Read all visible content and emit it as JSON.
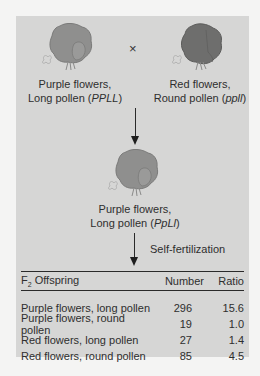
{
  "diagram": {
    "parents": {
      "left": {
        "line1": "Purple flowers,",
        "line2_prefix": "Long pollen (",
        "genotype": "PPLL",
        "line2_suffix": ")",
        "flower_color": "#8f8f8e"
      },
      "cross_symbol": "×",
      "right": {
        "line1": "Red flowers,",
        "line2_prefix": "Round pollen (",
        "genotype": "ppll",
        "line2_suffix": ")",
        "flower_color": "#6e6e6d"
      }
    },
    "f1": {
      "line1": "Purple flowers,",
      "line2_prefix": "Long pollen (",
      "genotype": "PpLl",
      "line2_suffix": ")",
      "flower_color": "#8f8f8e"
    },
    "step_label": "Self-fertilization",
    "table": {
      "header": {
        "col1_prefix": "F",
        "col1_sub": "2",
        "col1_suffix": " Offspring",
        "col2": "Number",
        "col3": "Ratio"
      },
      "rows": [
        {
          "phenotype": "Purple flowers, long pollen",
          "number": "296",
          "ratio": "15.6"
        },
        {
          "phenotype": "Purple flowers, round pollen",
          "number": "19",
          "ratio": "1.0"
        },
        {
          "phenotype": "Red flowers, long pollen",
          "number": "27",
          "ratio": "1.4"
        },
        {
          "phenotype": "Red flowers, round pollen",
          "number": "85",
          "ratio": "4.5"
        }
      ]
    }
  },
  "colors": {
    "panel_bg": "#d6d6d5",
    "page_bg": "#f4f4f3",
    "line": "#2a2a2a"
  }
}
